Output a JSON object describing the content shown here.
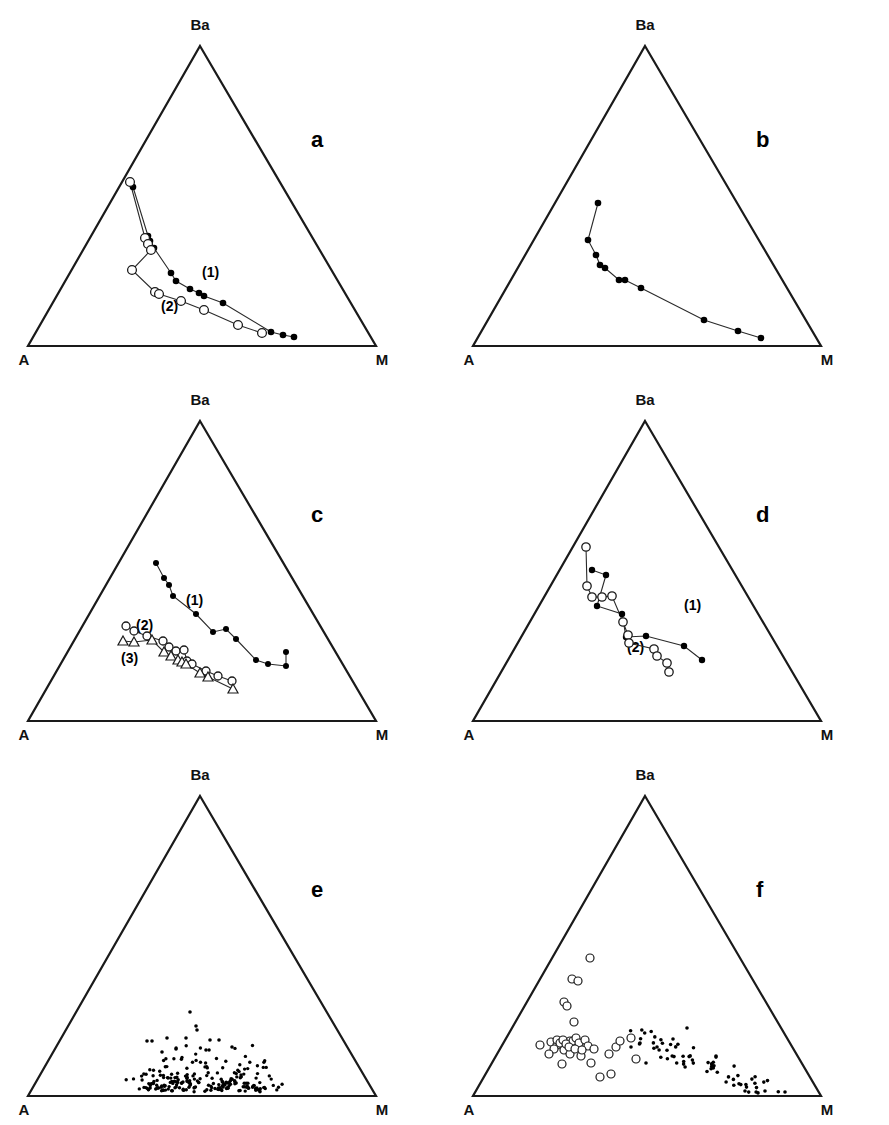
{
  "figure": {
    "type": "multi-panel-ternary-figure",
    "panel_count": 6,
    "layout": "2 columns x 3 rows",
    "vertex_labels": {
      "top": "Ba",
      "bottom_left": "A",
      "bottom_right": "M"
    }
  },
  "panels": [
    {
      "id": "a",
      "label": "a",
      "series_labels": [
        "(1)",
        "(2)"
      ]
    },
    {
      "id": "b",
      "label": "b",
      "series_labels": []
    },
    {
      "id": "c",
      "label": "c",
      "series_labels": [
        "(1)",
        "(2)",
        "(3)"
      ]
    },
    {
      "id": "d",
      "label": "d",
      "series_labels": [
        "(1)",
        "(2)"
      ]
    },
    {
      "id": "e",
      "label": "e",
      "series_labels": []
    },
    {
      "id": "f",
      "label": "f",
      "series_labels": []
    }
  ],
  "chart_data": [
    {
      "type": "scatter",
      "panel": "a",
      "title": "a",
      "axes": [
        "A",
        "Ba",
        "M"
      ],
      "ternary": true,
      "series": [
        {
          "name": "(1)",
          "marker": "filled-circle",
          "connected": true,
          "points": [
            [
              0.54,
              0.355,
              0.105
            ],
            [
              0.56,
              0.205,
              0.235
            ],
            [
              0.553,
              0.196,
              0.251
            ],
            [
              0.566,
              0.17,
              0.264
            ],
            [
              0.517,
              0.139,
              0.344
            ],
            [
              0.5,
              0.126,
              0.374
            ],
            [
              0.452,
              0.101,
              0.447
            ],
            [
              0.418,
              0.093,
              0.489
            ],
            [
              0.398,
              0.09,
              0.512
            ],
            [
              0.33,
              0.072,
              0.598
            ],
            [
              0.152,
              0.02,
              0.828
            ],
            [
              0.108,
              0.018,
              0.874
            ],
            [
              0.068,
              0.016,
              0.916
            ]
          ]
        },
        {
          "name": "(2)",
          "marker": "open-circle",
          "connected": true,
          "points": [
            [
              0.58,
              0.4,
              0.02
            ],
            [
              0.566,
              0.2,
              0.234
            ],
            [
              0.578,
              0.186,
              0.236
            ],
            [
              0.61,
              0.178,
              0.212
            ],
            [
              0.646,
              0.134,
              0.22
            ],
            [
              0.556,
              0.104,
              0.34
            ],
            [
              0.544,
              0.102,
              0.354
            ],
            [
              0.468,
              0.08,
              0.452
            ],
            [
              0.386,
              0.058,
              0.556
            ],
            [
              0.266,
              0.038,
              0.696
            ],
            [
              0.178,
              0.034,
              0.788
            ]
          ]
        }
      ]
    },
    {
      "type": "scatter",
      "panel": "b",
      "title": "b",
      "axes": [
        "A",
        "Ba",
        "M"
      ],
      "ternary": true,
      "series": [
        {
          "name": "trend",
          "marker": "filled-circle",
          "connected": true,
          "points": [
            [
              0.545,
              0.36,
              0.095
            ],
            [
              0.6,
              0.228,
              0.172
            ],
            [
              0.578,
              0.196,
              0.226
            ],
            [
              0.57,
              0.176,
              0.254
            ],
            [
              0.556,
              0.168,
              0.276
            ],
            [
              0.524,
              0.138,
              0.338
            ],
            [
              0.506,
              0.136,
              0.358
            ],
            [
              0.462,
              0.118,
              0.42
            ],
            [
              0.272,
              0.06,
              0.668
            ],
            [
              0.172,
              0.04,
              0.788
            ],
            [
              0.118,
              0.026,
              0.856
            ]
          ]
        }
      ]
    },
    {
      "type": "scatter",
      "panel": "c",
      "title": "c",
      "axes": [
        "A",
        "Ba",
        "M"
      ],
      "ternary": true,
      "series": [
        {
          "name": "(1)",
          "marker": "filled-circle",
          "connected": true,
          "points": [
            [
              0.565,
              0.4,
              0.035
            ],
            [
              0.54,
              0.352,
              0.108
            ],
            [
              0.534,
              0.334,
              0.132
            ],
            [
              0.528,
              0.31,
              0.162
            ],
            [
              0.52,
              0.284,
              0.196
            ],
            [
              0.452,
              0.25,
              0.298
            ],
            [
              0.408,
              0.21,
              0.382
            ],
            [
              0.388,
              0.224,
              0.388
            ],
            [
              0.35,
              0.208,
              0.442
            ],
            [
              0.256,
              0.16,
              0.584
            ],
            [
              0.204,
              0.136,
              0.66
            ],
            [
              0.158,
              0.132,
              0.71
            ],
            [
              0.16,
              0.168,
              0.672
            ]
          ]
        },
        {
          "name": "(2)",
          "marker": "open-circle",
          "connected": true,
          "points": [
            [
              0.672,
              0.216,
              0.112
            ],
            [
              0.64,
              0.206,
              0.154
            ],
            [
              0.6,
              0.2,
              0.2
            ],
            [
              0.548,
              0.196,
              0.256
            ],
            [
              0.528,
              0.178,
              0.294
            ],
            [
              0.5,
              0.17,
              0.33
            ],
            [
              0.466,
              0.172,
              0.362
            ],
            [
              0.47,
              0.136,
              0.394
            ],
            [
              0.45,
              0.128,
              0.422
            ],
            [
              0.404,
              0.11,
              0.486
            ],
            [
              0.364,
              0.104,
              0.532
            ],
            [
              0.312,
              0.092,
              0.596
            ]
          ]
        },
        {
          "name": "(3)",
          "marker": "open-triangle",
          "connected": true,
          "points": [
            [
              0.676,
              0.176,
              0.148
            ],
            [
              0.628,
              0.174,
              0.198
            ],
            [
              0.566,
              0.182,
              0.252
            ],
            [
              0.534,
              0.152,
              0.314
            ],
            [
              0.508,
              0.14,
              0.352
            ],
            [
              0.48,
              0.134,
              0.386
            ],
            [
              0.466,
              0.128,
              0.406
            ],
            [
              0.452,
              0.124,
              0.424
            ],
            [
              0.386,
              0.108,
              0.506
            ],
            [
              0.346,
              0.1,
              0.554
            ],
            [
              0.252,
              0.07,
              0.678
            ]
          ]
        }
      ]
    },
    {
      "type": "scatter",
      "panel": "d",
      "title": "d",
      "axes": [
        "A",
        "Ba",
        "M"
      ],
      "ternary": true,
      "series": [
        {
          "name": "(1)",
          "marker": "filled-circle",
          "connected": true,
          "points": [
            [
              0.546,
              0.318,
              0.136
            ],
            [
              0.504,
              0.308,
              0.188
            ],
            [
              0.524,
              0.218,
              0.258
            ],
            [
              0.452,
              0.208,
              0.34
            ],
            [
              0.428,
              0.172,
              0.4
            ],
            [
              0.378,
              0.172,
              0.45
            ],
            [
              0.3,
              0.144,
              0.556
            ],
            [
              0.236,
              0.118,
              0.646
            ]
          ]
        },
        {
          "name": "(2)",
          "marker": "open-circle",
          "connected": true,
          "points": [
            [
              0.6,
              0.366,
              0.034
            ],
            [
              0.646,
              0.232,
              0.122
            ],
            [
              0.66,
              0.198,
              0.142
            ],
            [
              0.626,
              0.196,
              0.178
            ],
            [
              0.596,
              0.196,
              0.208
            ],
            [
              0.5,
              0.158,
              0.342
            ],
            [
              0.44,
              0.172,
              0.388
            ],
            [
              0.428,
              0.148,
              0.424
            ],
            [
              0.334,
              0.118,
              0.548
            ],
            [
              0.318,
              0.1,
              0.582
            ],
            [
              0.278,
              0.084,
              0.638
            ],
            [
              0.268,
              0.06,
              0.672
            ]
          ]
        }
      ]
    },
    {
      "type": "scatter",
      "panel": "e",
      "title": "e",
      "axes": [
        "A",
        "Ba",
        "M"
      ],
      "ternary": true,
      "marker": "small-filled-dot",
      "point_count": 220,
      "distribution": "dense cluster near the A-M base, skewed toward M",
      "series": [
        {
          "name": "samples",
          "marker": "filled-dot",
          "connected": false
        }
      ]
    },
    {
      "type": "scatter",
      "panel": "f",
      "title": "f",
      "axes": [
        "A",
        "Ba",
        "M"
      ],
      "ternary": true,
      "series": [
        {
          "name": "open-symbol-group",
          "marker": "open-circle",
          "connected": false,
          "point_count": 38,
          "distribution": "clustered near the A-Ba edge and mid-left"
        },
        {
          "name": "filled-symbol-group",
          "marker": "filled-dot",
          "connected": false,
          "point_count": 68,
          "distribution": "trending from centre toward the M vertex along the base"
        }
      ]
    }
  ]
}
